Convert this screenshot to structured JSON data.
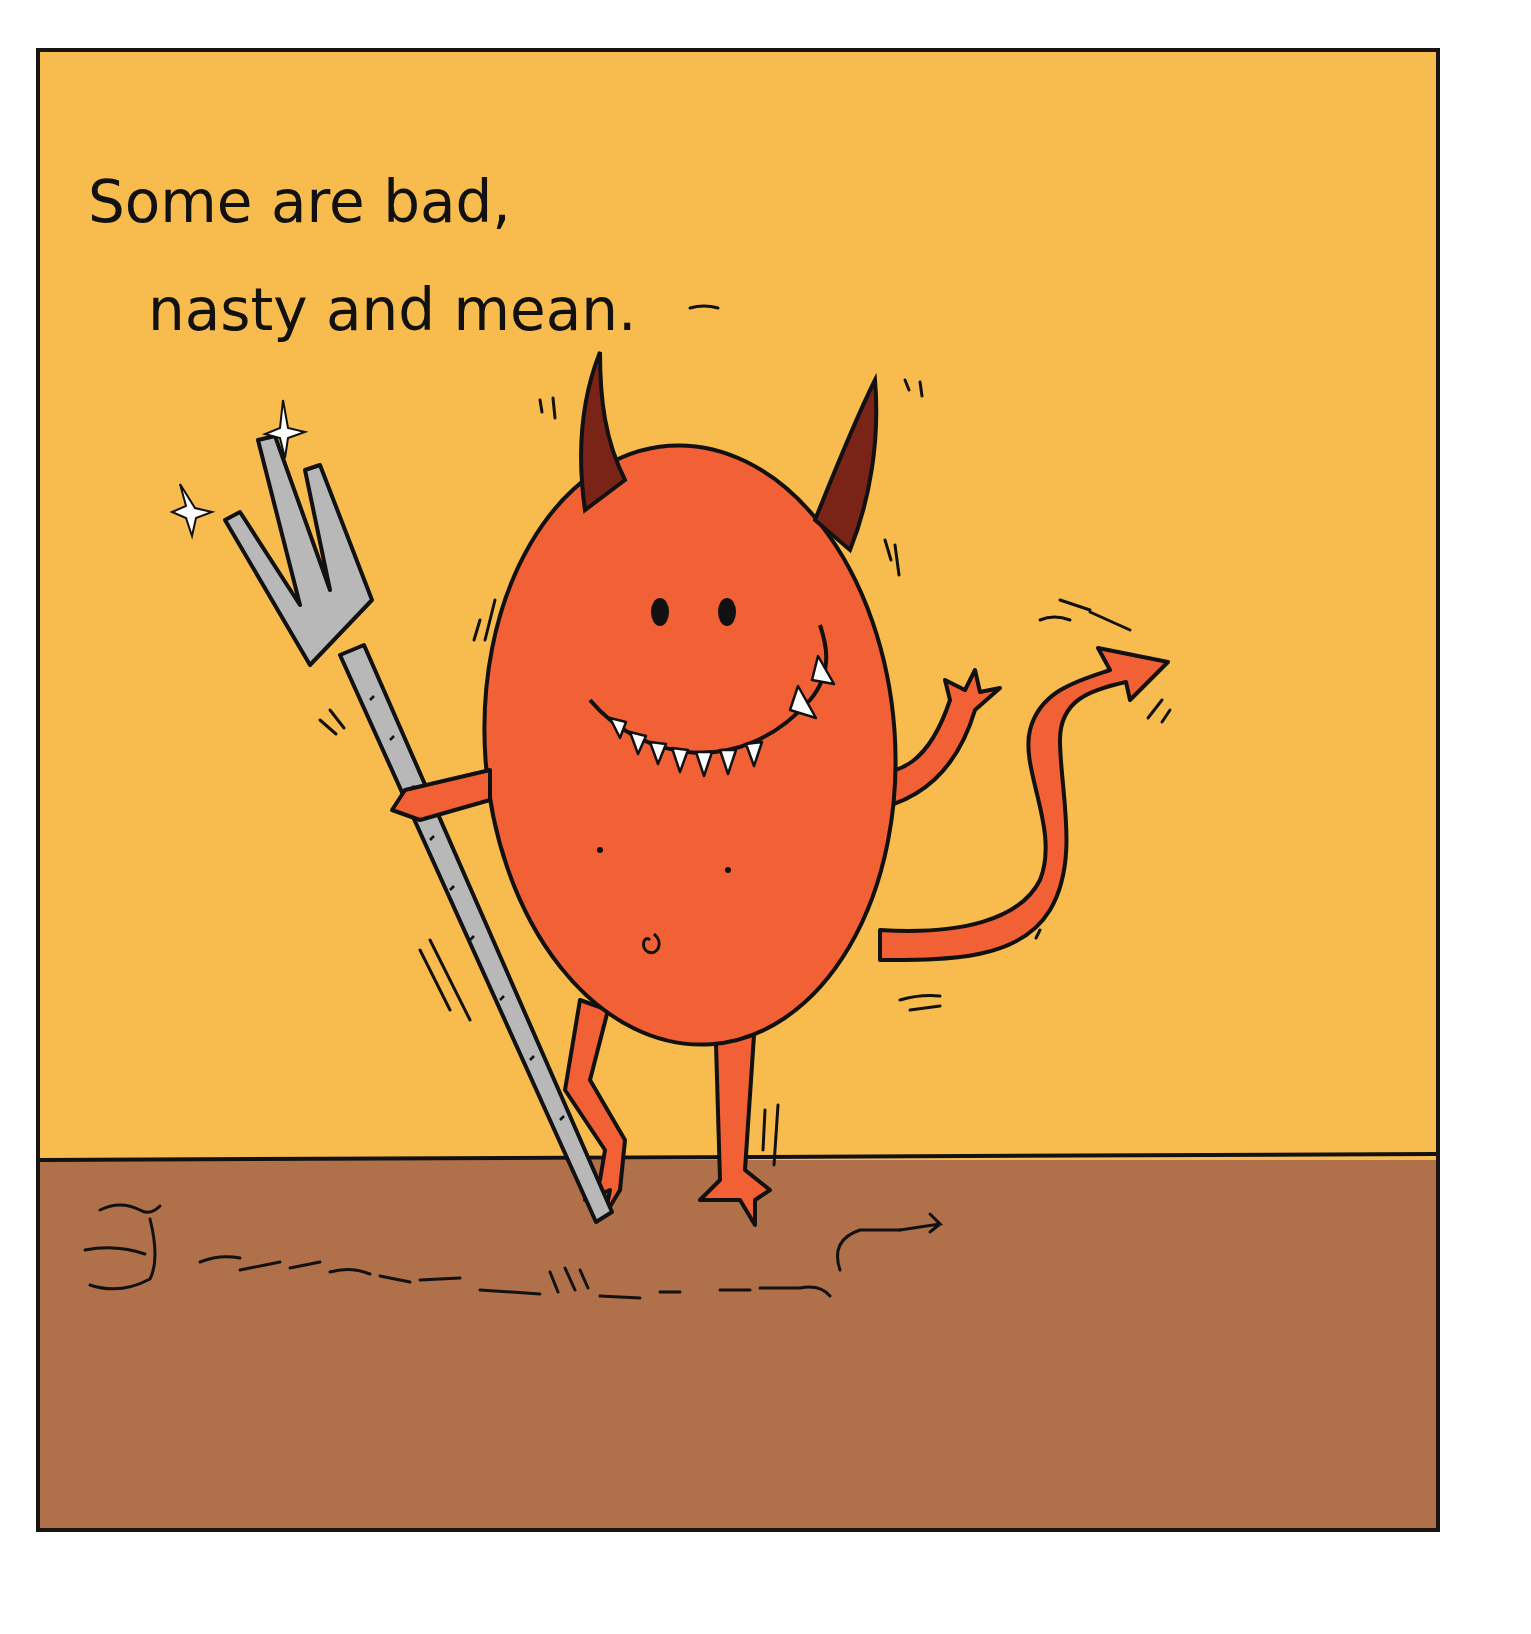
{
  "page": {
    "caption_lines": [
      "Some are bad,",
      "nasty and mean."
    ]
  },
  "scene": {
    "subject": "smiling red devil with horns, trident and arrow-tipped tail",
    "elements": [
      "devil",
      "horns",
      "trident",
      "tail",
      "ground",
      "motion-lines",
      "footprint-trail"
    ]
  },
  "colors": {
    "sky": "#F8BC4E",
    "ground": "#B0704A",
    "devil_body": "#F26035",
    "horns": "#7A2418",
    "trident": "#B8B8B8",
    "outline": "#111111",
    "frame_border": "#1A1410",
    "page_background": "#FFFFFF"
  }
}
